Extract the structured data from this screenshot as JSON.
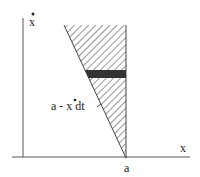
{
  "diagram": {
    "y_axis_label": "x",
    "y_axis_label_accent": "dot",
    "x_axis_label": "x",
    "apex_label": "a",
    "strip_label": "a - x dt",
    "strip_label_parts": {
      "before": "a - ",
      "var": "x",
      "after": " dt"
    },
    "colors": {
      "axis": "#555555",
      "hatch": "#333333",
      "strip": "#333333",
      "text": "#222222"
    }
  }
}
